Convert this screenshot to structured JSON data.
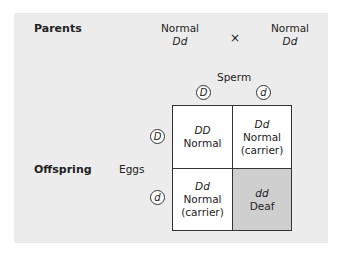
{
  "labels": {
    "parents": "Parents",
    "offspring": "Offspring",
    "sperm": "Sperm",
    "eggs": "Eggs",
    "cross": "×"
  },
  "parents": [
    {
      "phenotype": "Normal",
      "genotype": "Dd"
    },
    {
      "phenotype": "Normal",
      "genotype": "Dd"
    }
  ],
  "sperm_alleles": [
    "D",
    "d"
  ],
  "egg_alleles": [
    "D",
    "d"
  ],
  "offspring_grid": [
    [
      {
        "genotype": "DD",
        "phenotype": "Normal",
        "note": ""
      },
      {
        "genotype": "Dd",
        "phenotype": "Normal",
        "note": "(carrier)"
      }
    ],
    [
      {
        "genotype": "Dd",
        "phenotype": "Normal",
        "note": "(carrier)"
      },
      {
        "genotype": "dd",
        "phenotype": "Deaf",
        "note": ""
      }
    ]
  ],
  "colors": {
    "panel_background": "#ececec",
    "cell_background": "#ffffff",
    "affected_cell": "#cfcfcf"
  }
}
